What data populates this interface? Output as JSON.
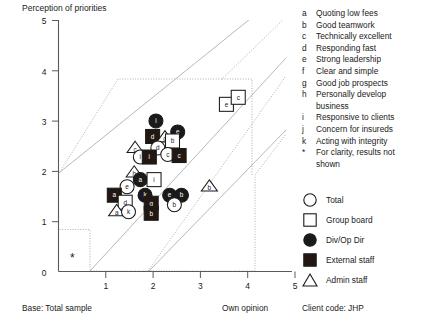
{
  "chart_data": {
    "type": "scatter",
    "title": "Perception of priorities",
    "xlabel": "Own opinion",
    "ylabel": "",
    "xlim": [
      0,
      5
    ],
    "ylim": [
      0,
      5
    ],
    "xticks": [
      "0",
      "1",
      "2",
      "3",
      "4",
      "5"
    ],
    "yticks": [
      "0",
      "1",
      "2",
      "3",
      "4",
      "5"
    ],
    "grid": false,
    "legend_position": "right",
    "series": [
      {
        "name": "Total",
        "marker": "circle-open",
        "fill": "#ffffff",
        "stroke": "#1a1a1a"
      },
      {
        "name": "Group board",
        "marker": "square-open",
        "fill": "#ffffff",
        "stroke": "#1a1a1a"
      },
      {
        "name": "Div/Op Dir",
        "marker": "circle-filled",
        "fill": "#1a1a1a",
        "stroke": "#1a1a1a"
      },
      {
        "name": "External staff",
        "marker": "square-filled",
        "fill": "#231712",
        "stroke": "#1a1a1a"
      },
      {
        "name": "Admin staff",
        "marker": "triangle-open",
        "fill": "#ffffff",
        "stroke": "#1a1a1a"
      }
    ],
    "points": [
      {
        "label": "i",
        "series": "Div/Op Dir",
        "x": 2.06,
        "y": 3.0
      },
      {
        "label": "e",
        "series": "Div/Op Dir",
        "x": 2.52,
        "y": 2.78
      },
      {
        "label": "d",
        "series": "External staff",
        "x": 1.99,
        "y": 2.69
      },
      {
        "label": "d",
        "series": "Admin staff",
        "x": 2.25,
        "y": 2.68
      },
      {
        "label": "b",
        "series": "Group board",
        "x": 2.41,
        "y": 2.6
      },
      {
        "label": "c",
        "series": "Admin staff",
        "x": 1.62,
        "y": 2.47
      },
      {
        "label": "d",
        "series": "Total",
        "x": 2.1,
        "y": 2.46
      },
      {
        "label": "c",
        "series": "Total",
        "x": 2.31,
        "y": 2.33
      },
      {
        "label": "c",
        "series": "External staff",
        "x": 2.55,
        "y": 2.31
      },
      {
        "label": "i",
        "series": "Total",
        "x": 1.73,
        "y": 2.28
      },
      {
        "label": "i",
        "series": "External staff",
        "x": 1.92,
        "y": 2.28
      },
      {
        "label": "h",
        "series": "Admin staff",
        "x": 1.6,
        "y": 1.98
      },
      {
        "label": "a",
        "series": "Div/Op Dir",
        "x": 1.73,
        "y": 1.83
      },
      {
        "label": "i",
        "series": "Group board",
        "x": 2.02,
        "y": 1.83
      },
      {
        "label": "b",
        "series": "Admin staff",
        "x": 3.19,
        "y": 1.7
      },
      {
        "label": "e",
        "series": "Total",
        "x": 1.45,
        "y": 1.69
      },
      {
        "label": "a",
        "series": "External staff",
        "x": 1.18,
        "y": 1.52
      },
      {
        "label": "k",
        "series": "Div/Op Dir",
        "x": 1.83,
        "y": 1.52
      },
      {
        "label": "e",
        "series": "Div/Op Dir",
        "x": 2.35,
        "y": 1.52
      },
      {
        "label": "b",
        "series": "Div/Op Dir",
        "x": 2.6,
        "y": 1.52
      },
      {
        "label": "d",
        "series": "Group board",
        "x": 1.41,
        "y": 1.38
      },
      {
        "label": "g",
        "series": "External staff",
        "x": 1.96,
        "y": 1.36
      },
      {
        "label": "b",
        "series": "Total",
        "x": 2.45,
        "y": 1.33
      },
      {
        "label": "a",
        "series": "Admin staff",
        "x": 1.23,
        "y": 1.21
      },
      {
        "label": "k",
        "series": "Total",
        "x": 1.48,
        "y": 1.19
      },
      {
        "label": "b",
        "series": "External staff",
        "x": 1.96,
        "y": 1.16
      },
      {
        "label": "e",
        "series": "Group board",
        "x": 3.55,
        "y": 3.33
      },
      {
        "label": "c",
        "series": "Group board",
        "x": 3.8,
        "y": 3.47
      }
    ],
    "annotations": [
      "*"
    ]
  },
  "chart": {
    "title": "Perception of priorities",
    "axis": {
      "x_title": "Own opinion",
      "base_note": "Base: Total sample",
      "x_ticks": [
        "0",
        "1",
        "2",
        "3",
        "4",
        "5"
      ],
      "y_ticks": [
        "0",
        "1",
        "2",
        "3",
        "4",
        "5"
      ]
    },
    "asterisk": "*"
  },
  "legend": {
    "letters": [
      {
        "key": "a",
        "text": "Quoting low fees"
      },
      {
        "key": "b",
        "text": "Good teamwork"
      },
      {
        "key": "c",
        "text": "Technically excellent"
      },
      {
        "key": "d",
        "text": "Responding fast"
      },
      {
        "key": "e",
        "text": "Strong leadership"
      },
      {
        "key": "f",
        "text": "Clear and simple"
      },
      {
        "key": "g",
        "text": "Good job prospects"
      },
      {
        "key": "h",
        "text": "Personally develop"
      },
      {
        "key": "h2",
        "text": "business"
      },
      {
        "key": "i",
        "text": "Responsive to clients"
      },
      {
        "key": "j",
        "text": "Concern for insureds"
      },
      {
        "key": "k",
        "text": "Acting with integrity"
      },
      {
        "key": "*",
        "text": "For clarity, results not"
      },
      {
        "key": "*2",
        "text": "shown"
      }
    ],
    "symbols": [
      {
        "icon": "circle-open-icon",
        "label": "Total"
      },
      {
        "icon": "square-open-icon",
        "label": "Group board"
      },
      {
        "icon": "circle-filled-icon",
        "label": "Div/Op Dir"
      },
      {
        "icon": "square-filled-icon",
        "label": "External staff"
      },
      {
        "icon": "triangle-open-icon",
        "label": "Admin staff"
      }
    ]
  },
  "footer": {
    "base": "Base: Total sample",
    "own_opinion": "Own opinion",
    "client_code": "Client code:  JHP"
  },
  "colors": {
    "ink": "#1a1a1a",
    "dark_fill": "#231712",
    "band": "#8a8a8a",
    "paper": "#ffffff"
  }
}
